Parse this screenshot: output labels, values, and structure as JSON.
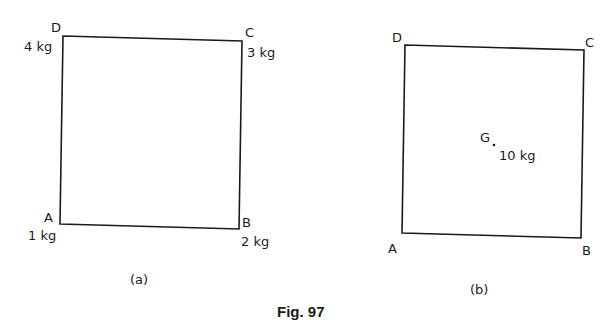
{
  "figure": {
    "caption": "Fig. 97",
    "colors": {
      "ink": "#1a1a1a",
      "background": "#ffffff"
    }
  },
  "panel_a": {
    "sublabel": "(a)",
    "vertices": {
      "A": {
        "label": "A",
        "mass": "1 kg"
      },
      "B": {
        "label": "B",
        "mass": "2 kg"
      },
      "C": {
        "label": "C",
        "mass": "3 kg"
      },
      "D": {
        "label": "D",
        "mass": "4 kg"
      }
    }
  },
  "panel_b": {
    "sublabel": "(b)",
    "vertices": {
      "A": {
        "label": "A"
      },
      "B": {
        "label": "B"
      },
      "C": {
        "label": "C"
      },
      "D": {
        "label": "D"
      }
    },
    "centroid": {
      "label": "G",
      "mass": "10 kg"
    }
  }
}
